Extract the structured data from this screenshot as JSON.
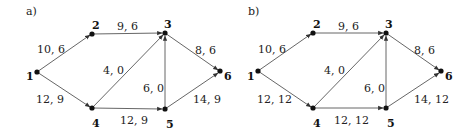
{
  "panels": [
    {
      "label": "a)",
      "nodes": [
        {
          "id": "1",
          "x": 37,
          "y": 72
        },
        {
          "id": "2",
          "x": 92,
          "y": 34
        },
        {
          "id": "3",
          "x": 165,
          "y": 33
        },
        {
          "id": "4",
          "x": 92,
          "y": 108
        },
        {
          "id": "5",
          "x": 165,
          "y": 109
        },
        {
          "id": "6",
          "x": 220,
          "y": 71
        }
      ],
      "edges": [
        {
          "from": "1",
          "to": "2",
          "label": "10, 6"
        },
        {
          "from": "2",
          "to": "3",
          "label": "9, 6"
        },
        {
          "from": "1",
          "to": "4",
          "label": "12, 9"
        },
        {
          "from": "4",
          "to": "3",
          "label": "4, 0"
        },
        {
          "from": "5",
          "to": "3",
          "label": "6, 0"
        },
        {
          "from": "4",
          "to": "5",
          "label": "12, 9"
        },
        {
          "from": "3",
          "to": "6",
          "label": "8, 6"
        },
        {
          "from": "5",
          "to": "6",
          "label": "14, 9"
        }
      ]
    },
    {
      "label": "b)",
      "nodes": [
        {
          "id": "1",
          "x": 258,
          "y": 71
        },
        {
          "id": "2",
          "x": 313,
          "y": 33
        },
        {
          "id": "3",
          "x": 386,
          "y": 33
        },
        {
          "id": "4",
          "x": 313,
          "y": 108
        },
        {
          "id": "5",
          "x": 386,
          "y": 108
        },
        {
          "id": "6",
          "x": 441,
          "y": 71
        }
      ],
      "edges": [
        {
          "from": "1",
          "to": "2",
          "label": "10, 6"
        },
        {
          "from": "2",
          "to": "3",
          "label": "9, 6"
        },
        {
          "from": "1",
          "to": "4",
          "label": "12, 12"
        },
        {
          "from": "4",
          "to": "3",
          "label": "4, 0"
        },
        {
          "from": "5",
          "to": "3",
          "label": "6, 0"
        },
        {
          "from": "4",
          "to": "5",
          "label": "12, 12"
        },
        {
          "from": "3",
          "to": "6",
          "label": "8, 6"
        },
        {
          "from": "5",
          "to": "6",
          "label": "14, 12"
        }
      ]
    }
  ]
}
